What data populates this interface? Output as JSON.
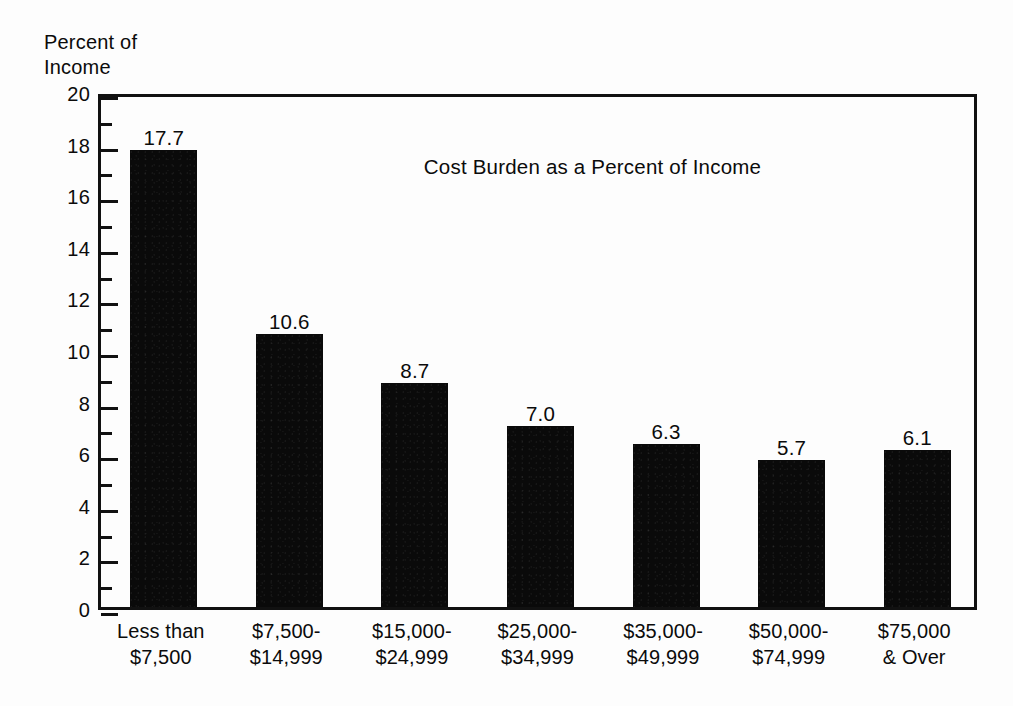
{
  "chart_data": {
    "type": "bar",
    "title": "Cost Burden as a Percent of Income",
    "xlabel": "",
    "ylabel": "Percent of\nIncome",
    "ylim": [
      0,
      20
    ],
    "ytick_step": 2,
    "yticks": [
      "20",
      "18",
      "16",
      "14",
      "12",
      "10",
      "8",
      "6",
      "4",
      "2",
      "0"
    ],
    "grid": false,
    "legend": null,
    "bar_color": "#0a0a0a",
    "categories": [
      "Less than\n$7,500",
      "$7,500-\n$14,999",
      "$15,000-\n$24,999",
      "$25,000-\n$34,999",
      "$35,000-\n$49,999",
      "$50,000-\n$74,999",
      "$75,000\n& Over"
    ],
    "values": [
      17.7,
      10.6,
      8.7,
      7.0,
      6.3,
      5.7,
      6.1
    ],
    "value_labels": [
      "17.7",
      "10.6",
      "8.7",
      "7.0",
      "6.3",
      "5.7",
      "6.1"
    ]
  }
}
